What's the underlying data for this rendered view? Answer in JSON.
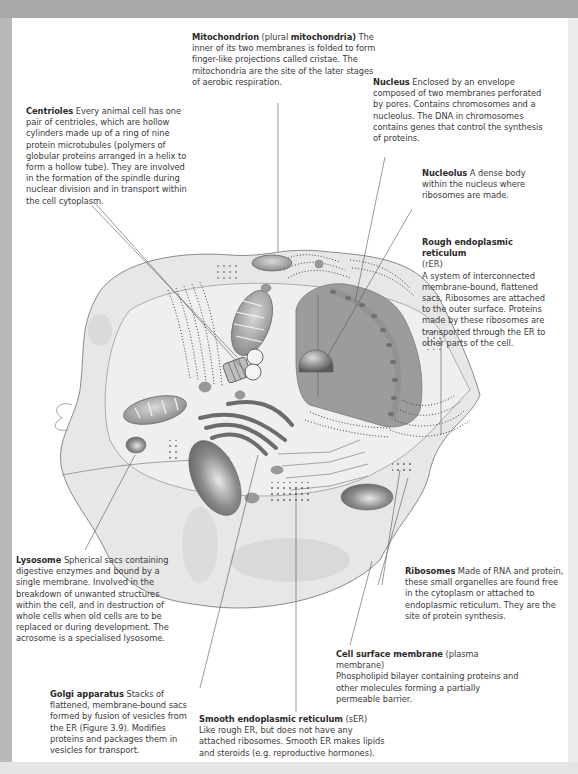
{
  "diagram": {
    "colors": {
      "cytoplasm": "#e6e6e6",
      "membrane_line": "#8a8a8a",
      "nucleus": "#9c9c9c",
      "organelle_dark": "#7a7a7a",
      "leader_line": "#555555",
      "frame": "#b9b9b9"
    },
    "labels": {
      "mitochondrion": {
        "term": "Mitochondrion",
        "paren_open": " (plural ",
        "term2": "mitochondria)",
        "text": " The inner of its two membranes is folded to form finger-like projections called cristae. The mitochondria are the site of the later stages of aerobic respiration."
      },
      "nucleus": {
        "term": "Nucleus",
        "text": " Enclosed by an envelope composed of two membranes perforated by pores. Contains chromosomes and a nucleolus. The DNA in chromosomes contains genes that control the synthesis of proteins."
      },
      "centrioles": {
        "term": "Centrioles",
        "text": " Every animal cell has one pair of centrioles, which are hollow cylinders made up of a ring of nine protein microtubules (polymers of globular proteins arranged in a helix to form a hollow tube). They are involved in the formation of the spindle during nuclear division and in transport within the cell cytoplasm."
      },
      "nucleolus": {
        "term": "Nucleolus",
        "text": " A dense body within the nucleus where ribosomes are made."
      },
      "rough_er": {
        "term": "Rough endoplasmic reticulum",
        "abbr": "(rER)",
        "text": "A system of interconnected membrane-bound, flattened sacs. Ribosomes are attached to the outer surface. Proteins made by these ribosomes are transported through the ER to other parts of the cell."
      },
      "lysosome": {
        "term": "Lysosome",
        "text": " Spherical sacs containing digestive enzymes and bound by a single membrane. Involved in the breakdown of unwanted structures within the cell, and in destruction of whole cells when old cells are to be replaced or during development. The acrosome is a specialised lysosome."
      },
      "ribosomes": {
        "term": "Ribosomes",
        "text": " Made of RNA and protein, these small organelles are found free in the cytoplasm or attached to endoplasmic reticulum. They are the site of protein synthesis."
      },
      "cell_membrane": {
        "term": "Cell surface membrane",
        "paren": " (plasma membrane)",
        "text": "Phospholipid bilayer containing proteins and other molecules forming a partially permeable barrier."
      },
      "golgi": {
        "term": "Golgi apparatus",
        "text": " Stacks of flattened, membrane-bound sacs formed by fusion of vesicles from the ER (Figure 3.9). Modifies proteins and packages them in vesicles for transport."
      },
      "smooth_er": {
        "term": "Smooth endoplasmic reticulum",
        "abbr": " (sER)",
        "text": "Like rough ER, but does not have any attached ribosomes. Smooth ER makes lipids and steroids (e.g. reproductive hormones)."
      }
    }
  }
}
